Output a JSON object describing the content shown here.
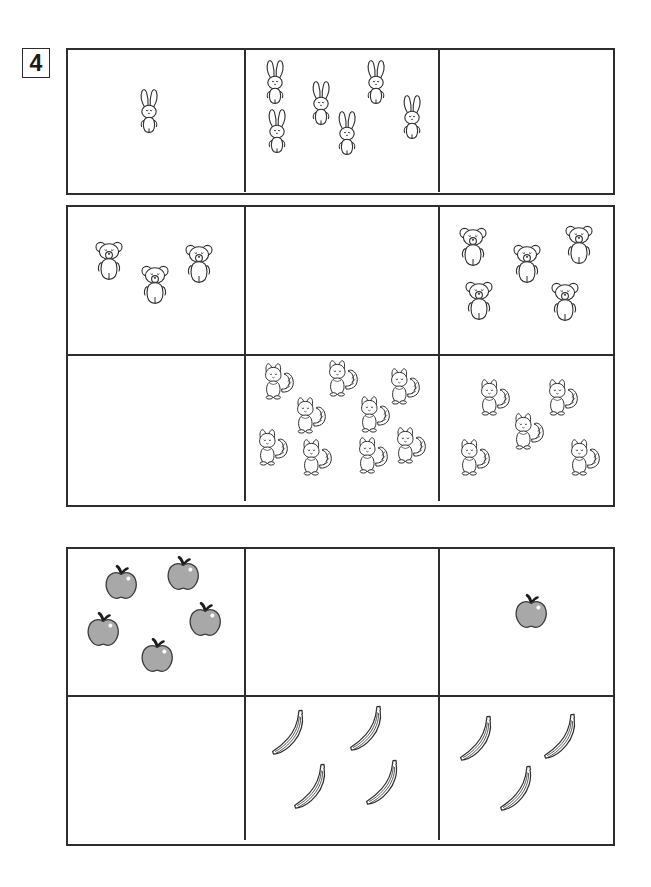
{
  "worksheet": {
    "exercise_number": "4",
    "ink_color": "#2e2e2e",
    "apple_fill": "#a8a8a8",
    "apple_stroke": "#3a3a3a",
    "apple_stem": "#1c1c1c"
  },
  "blocks": [
    {
      "name": "rabbit-block",
      "top": 48,
      "height": 147,
      "rows": [
        {
          "name": "rabbit-row",
          "cells": [
            {
              "name": "rabbit-cell-left",
              "icon": "rabbit-icon",
              "count": 1,
              "label": "1 rabbit"
            },
            {
              "name": "rabbit-cell-middle",
              "icon": "rabbit-icon",
              "count": 6,
              "label": "6 rabbits"
            },
            {
              "name": "rabbit-cell-right",
              "icon": "none",
              "count": 0,
              "label": "empty"
            }
          ]
        }
      ]
    },
    {
      "name": "bear-squirrel-block",
      "top": 205,
      "height": 302,
      "rows": [
        {
          "name": "bear-row",
          "cells": [
            {
              "name": "bear-cell-left",
              "icon": "bear-icon",
              "count": 3,
              "label": "3 bears"
            },
            {
              "name": "bear-cell-middle",
              "icon": "none",
              "count": 0,
              "label": "empty"
            },
            {
              "name": "bear-cell-right",
              "icon": "bear-icon",
              "count": 5,
              "label": "5 bears"
            }
          ]
        },
        {
          "name": "squirrel-row",
          "cells": [
            {
              "name": "squirrel-cell-left",
              "icon": "none",
              "count": 0,
              "label": "empty"
            },
            {
              "name": "squirrel-cell-middle",
              "icon": "squirrel-icon",
              "count": 9,
              "label": "9 squirrels"
            },
            {
              "name": "squirrel-cell-right",
              "icon": "squirrel-icon",
              "count": 5,
              "label": "5 squirrels"
            }
          ]
        }
      ]
    },
    {
      "name": "fruit-block",
      "top": 547,
      "height": 299,
      "rows": [
        {
          "name": "apple-row",
          "cells": [
            {
              "name": "apple-cell-left",
              "icon": "apple-icon",
              "count": 5,
              "label": "5 apples"
            },
            {
              "name": "apple-cell-middle",
              "icon": "none",
              "count": 0,
              "label": "empty"
            },
            {
              "name": "apple-cell-right",
              "icon": "apple-icon",
              "count": 1,
              "label": "1 apple"
            }
          ]
        },
        {
          "name": "banana-row",
          "cells": [
            {
              "name": "banana-cell-left",
              "icon": "none",
              "count": 0,
              "label": "empty"
            },
            {
              "name": "banana-cell-middle",
              "icon": "banana-icon",
              "count": 4,
              "label": "4 bananas"
            },
            {
              "name": "banana-cell-right",
              "icon": "banana-icon",
              "count": 3,
              "label": "3 bananas"
            }
          ]
        }
      ]
    }
  ],
  "sprite_layout": {
    "rabbit-cell-left": [
      {
        "x": 68,
        "y": 38,
        "s": 1.0
      }
    ],
    "rabbit-cell-middle": [
      {
        "x": 16,
        "y": 9,
        "s": 1.0
      },
      {
        "x": 62,
        "y": 30,
        "s": 1.0
      },
      {
        "x": 117,
        "y": 9,
        "s": 1.0
      },
      {
        "x": 153,
        "y": 44,
        "s": 1.0
      },
      {
        "x": 18,
        "y": 58,
        "s": 1.0
      },
      {
        "x": 88,
        "y": 60,
        "s": 1.0
      }
    ],
    "bear-cell-left": [
      {
        "x": 24,
        "y": 32,
        "s": 1.0
      },
      {
        "x": 70,
        "y": 56,
        "s": 1.0
      },
      {
        "x": 114,
        "y": 35,
        "s": 1.0
      }
    ],
    "bear-cell-right": [
      {
        "x": 16,
        "y": 18,
        "s": 1.0
      },
      {
        "x": 70,
        "y": 35,
        "s": 1.0
      },
      {
        "x": 122,
        "y": 16,
        "s": 1.0
      },
      {
        "x": 22,
        "y": 72,
        "s": 1.0
      },
      {
        "x": 108,
        "y": 73,
        "s": 1.0
      }
    ],
    "squirrel-cell-middle": [
      {
        "x": 14,
        "y": 6,
        "s": 1.0
      },
      {
        "x": 78,
        "y": 3,
        "s": 1.0
      },
      {
        "x": 140,
        "y": 11,
        "s": 1.0
      },
      {
        "x": 46,
        "y": 40,
        "s": 1.0
      },
      {
        "x": 110,
        "y": 39,
        "s": 1.0
      },
      {
        "x": 8,
        "y": 72,
        "s": 1.0
      },
      {
        "x": 52,
        "y": 82,
        "s": 1.0
      },
      {
        "x": 108,
        "y": 80,
        "s": 1.0
      },
      {
        "x": 146,
        "y": 70,
        "s": 1.0
      }
    ],
    "squirrel-cell-right": [
      {
        "x": 36,
        "y": 22,
        "s": 1.0
      },
      {
        "x": 104,
        "y": 22,
        "s": 1.0
      },
      {
        "x": 70,
        "y": 56,
        "s": 1.0
      },
      {
        "x": 16,
        "y": 82,
        "s": 1.0
      },
      {
        "x": 126,
        "y": 82,
        "s": 1.0
      }
    ],
    "apple-cell-left": [
      {
        "x": 34,
        "y": 15,
        "s": 1.0
      },
      {
        "x": 96,
        "y": 6,
        "s": 1.0
      },
      {
        "x": 16,
        "y": 62,
        "s": 1.0
      },
      {
        "x": 118,
        "y": 52,
        "s": 1.0
      },
      {
        "x": 70,
        "y": 88,
        "s": 1.0
      }
    ],
    "apple-cell-right": [
      {
        "x": 72,
        "y": 44,
        "s": 1.0
      }
    ],
    "banana-cell-middle": [
      {
        "x": 22,
        "y": 12,
        "s": 1.0
      },
      {
        "x": 100,
        "y": 8,
        "s": 1.0
      },
      {
        "x": 44,
        "y": 66,
        "s": 1.0
      },
      {
        "x": 116,
        "y": 62,
        "s": 1.0
      }
    ],
    "banana-cell-right": [
      {
        "x": 16,
        "y": 18,
        "s": 1.0
      },
      {
        "x": 100,
        "y": 16,
        "s": 1.0
      },
      {
        "x": 56,
        "y": 68,
        "s": 1.0
      }
    ]
  }
}
